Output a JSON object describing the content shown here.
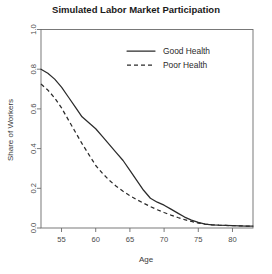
{
  "chart_data": {
    "type": "line",
    "title": "Simulated Labor Market Participation",
    "xlabel": "Age",
    "ylabel": "Share of Workers",
    "xlim": [
      52,
      83
    ],
    "ylim": [
      0.0,
      1.0
    ],
    "xticks": [
      55,
      60,
      65,
      70,
      75,
      80
    ],
    "xtick_labels": [
      "55",
      "60",
      "65",
      "70",
      "75",
      "80"
    ],
    "yticks": [
      0.0,
      0.2,
      0.4,
      0.6,
      0.8,
      1.0
    ],
    "ytick_labels": [
      "0.0",
      "0.2",
      "0.4",
      "0.6",
      "0.8",
      "1.0"
    ],
    "grid": false,
    "legend_position": "top-center",
    "x": [
      52,
      53,
      54,
      55,
      56,
      57,
      58,
      59,
      60,
      61,
      62,
      63,
      64,
      65,
      66,
      67,
      68,
      69,
      70,
      71,
      72,
      73,
      74,
      75,
      76,
      77,
      78,
      79,
      80,
      81,
      82,
      83
    ],
    "series": [
      {
        "name": "Good Health",
        "style": "solid",
        "color": "#2b2b2b",
        "values": [
          0.8,
          0.78,
          0.75,
          0.71,
          0.66,
          0.61,
          0.56,
          0.53,
          0.5,
          0.46,
          0.42,
          0.38,
          0.34,
          0.29,
          0.24,
          0.19,
          0.15,
          0.13,
          0.115,
          0.095,
          0.075,
          0.055,
          0.04,
          0.028,
          0.02,
          0.016,
          0.014,
          0.013,
          0.012,
          0.011,
          0.01,
          0.01
        ]
      },
      {
        "name": "Poor Health",
        "style": "dashed",
        "color": "#2b2b2b",
        "values": [
          0.725,
          0.695,
          0.655,
          0.605,
          0.545,
          0.485,
          0.425,
          0.37,
          0.315,
          0.275,
          0.24,
          0.21,
          0.185,
          0.163,
          0.143,
          0.125,
          0.108,
          0.092,
          0.078,
          0.065,
          0.053,
          0.042,
          0.033,
          0.025,
          0.019,
          0.016,
          0.014,
          0.013,
          0.012,
          0.011,
          0.01,
          0.01
        ]
      }
    ]
  }
}
